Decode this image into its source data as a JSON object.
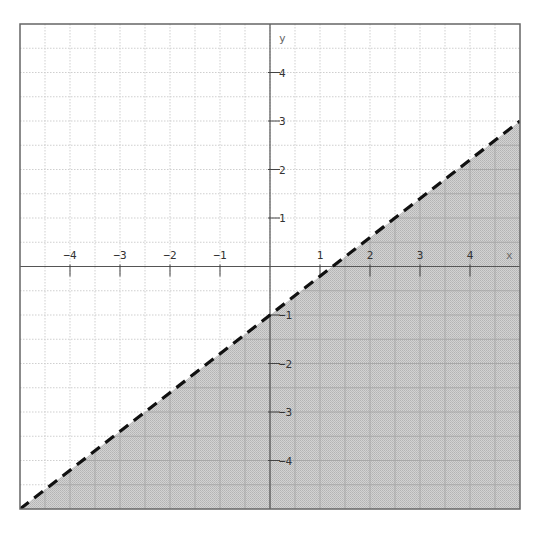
{
  "chart_data": {
    "type": "area",
    "title": "",
    "subtitle": "",
    "xlabel": "x",
    "ylabel": "y",
    "xlim": [
      -5,
      5
    ],
    "ylim": [
      -5,
      5
    ],
    "grid": true,
    "grid_step": 0.5,
    "x_ticks": [
      -4,
      -3,
      -2,
      -1,
      1,
      2,
      3,
      4
    ],
    "y_ticks": [
      -4,
      -3,
      -2,
      -1,
      1,
      2,
      3,
      4
    ],
    "x_tick_labels": [
      "−4",
      "−3",
      "−2",
      "−1",
      "1",
      "2",
      "3",
      "4"
    ],
    "y_tick_labels": [
      "−4",
      "−3",
      "−2",
      "−1",
      "1",
      "2",
      "3",
      "4"
    ],
    "series": [
      {
        "name": "boundary line",
        "kind": "line",
        "style": "dashed",
        "equation": "y = 0.8x - 1",
        "slope": 0.8,
        "intercept": -1,
        "points": [
          [
            -5,
            -5
          ],
          [
            5,
            3
          ]
        ],
        "color": "#111111"
      },
      {
        "name": "solution region",
        "kind": "shaded",
        "inequality": "y < 0.8x - 1",
        "region": "below line",
        "polygon": [
          [
            -5,
            -5
          ],
          [
            5,
            3
          ],
          [
            5,
            -5
          ]
        ],
        "color": "#c4c4c4"
      }
    ],
    "legend": null,
    "annotations": []
  },
  "colors": {
    "background": "#ffffff",
    "frame": "#666666",
    "axis": "#555555",
    "grid": "#cfcfcf",
    "shade": "#c4c4c4",
    "shade_grid": "#a8a8a8",
    "line": "#111111"
  }
}
